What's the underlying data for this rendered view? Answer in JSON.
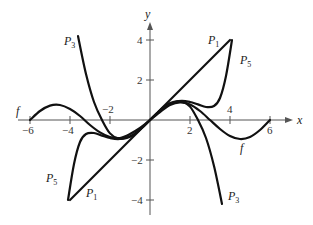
{
  "chart_data": {
    "type": "line",
    "title": "",
    "xlabel": "x",
    "ylabel": "y",
    "xlim": [
      -6.5,
      7
    ],
    "ylim": [
      -4.5,
      5
    ],
    "grid": false,
    "legend": "inline labels",
    "x_ticks": [
      -6,
      -4,
      -2,
      2,
      4,
      6
    ],
    "x_tick_labels": [
      "−6",
      "−4",
      "−2",
      "2",
      "4",
      "6"
    ],
    "y_ticks": [
      4,
      2,
      -2,
      -4
    ],
    "y_tick_labels": [
      "4",
      "2",
      "−2",
      "−4"
    ],
    "series": [
      {
        "name": "f",
        "x": [
          -6.0,
          -5.5,
          -5.0,
          -4.5,
          -4.0,
          -3.5,
          -3.0,
          -2.5,
          -2.0,
          -1.5,
          -1.0,
          -0.5,
          0.0,
          0.5,
          1.0,
          1.5,
          2.0,
          2.5,
          3.0,
          3.5,
          4.0,
          4.5,
          5.0,
          5.5,
          6.0
        ],
        "y": [
          0.0,
          0.45,
          0.72,
          0.75,
          0.55,
          0.2,
          -0.25,
          -0.62,
          -0.85,
          -0.9,
          -0.7,
          -0.4,
          0.0,
          0.4,
          0.75,
          0.88,
          0.78,
          0.45,
          0.0,
          -0.45,
          -0.8,
          -0.95,
          -0.85,
          -0.5,
          0.0
        ]
      },
      {
        "name": "P1",
        "x": [
          -4.0,
          4.0
        ],
        "y": [
          -4.0,
          4.0
        ]
      },
      {
        "name": "P3",
        "x": [
          -3.6,
          -3.2,
          -2.8,
          -2.4,
          -2.0,
          -1.6,
          -1.2,
          -0.8,
          -0.4,
          0.0,
          0.4,
          0.8,
          1.2,
          1.6,
          2.0,
          2.4,
          2.8,
          3.2,
          3.6
        ],
        "y": [
          4.2,
          2.3,
          0.9,
          0.0,
          -0.67,
          -0.92,
          -0.91,
          -0.73,
          -0.39,
          0.0,
          0.39,
          0.73,
          0.91,
          0.92,
          0.67,
          0.0,
          -0.9,
          -2.3,
          -4.2
        ]
      },
      {
        "name": "P5",
        "x": [
          -4.1,
          -3.8,
          -3.5,
          -3.2,
          -2.8,
          -2.4,
          -2.0,
          -1.6,
          -1.2,
          -0.8,
          -0.4,
          0.0,
          0.4,
          0.8,
          1.2,
          1.6,
          2.0,
          2.4,
          2.8,
          3.2,
          3.5,
          3.8,
          4.1
        ],
        "y": [
          -4.0,
          -2.2,
          -1.1,
          -0.7,
          -0.65,
          -0.78,
          -0.9,
          -0.96,
          -0.89,
          -0.71,
          -0.39,
          0.0,
          0.39,
          0.71,
          0.89,
          0.96,
          0.9,
          0.78,
          0.65,
          0.7,
          1.1,
          2.2,
          4.0
        ]
      }
    ],
    "annotations": [
      {
        "text": "f",
        "x": -6.2,
        "y": 0.35
      },
      {
        "text": "f",
        "x": 4.6,
        "y": -1.5
      },
      {
        "text": "P1",
        "x": 3.0,
        "y": 4.0
      },
      {
        "text": "P1",
        "x": -3.1,
        "y": -3.6
      },
      {
        "text": "P3",
        "x": -4.6,
        "y": 3.6
      },
      {
        "text": "P3",
        "x": 4.1,
        "y": -3.6
      },
      {
        "text": "P5",
        "x": 4.5,
        "y": 2.7
      },
      {
        "text": "P5",
        "x": -5.1,
        "y": -2.1
      }
    ]
  },
  "axes": {
    "x_label": "x",
    "y_label": "y",
    "x_ticks": [
      "−6",
      "−4",
      "−2",
      "2",
      "4",
      "6"
    ],
    "y_ticks": [
      "4",
      "2",
      "−2",
      "−4"
    ]
  },
  "labels": {
    "f_left": "f",
    "f_right": "f",
    "p_letter": "P",
    "p1_sub": "1",
    "p3_sub": "3",
    "p5_sub": "5"
  }
}
